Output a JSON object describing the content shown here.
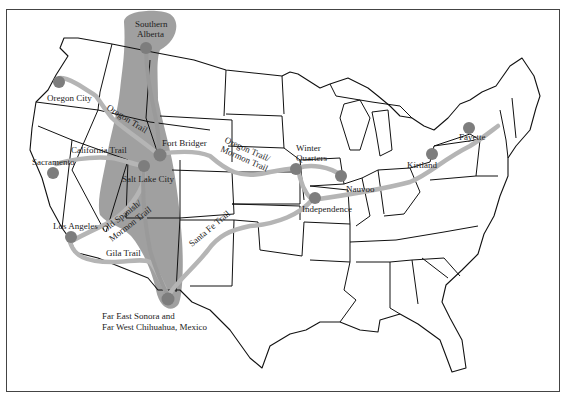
{
  "map": {
    "subject": "Western United States migration trails map",
    "colors": {
      "background": "#ffffff",
      "state_lines": "#111111",
      "trail_lines": "#b5b5b5",
      "settlement_region": "#8f8f8f",
      "location_markers": "#7d7d7d",
      "frame": "#444444"
    },
    "locations": [
      {
        "id": "southern-alberta",
        "label_line1": "Southern",
        "label_line2": "Alberta"
      },
      {
        "id": "oregon-city",
        "label": "Oregon City"
      },
      {
        "id": "fort-bridger",
        "label": "Fort Bridger"
      },
      {
        "id": "salt-lake-city",
        "label": "Salt Lake City"
      },
      {
        "id": "sacramento",
        "label": "Sacramento"
      },
      {
        "id": "los-angeles",
        "label": "Los Angeles"
      },
      {
        "id": "winter-quarters",
        "label_line1": "Winter",
        "label_line2": "Quarters"
      },
      {
        "id": "nauvoo",
        "label": "Nauvoo"
      },
      {
        "id": "independence",
        "label": "Independence"
      },
      {
        "id": "kirtland",
        "label": "Kirtland"
      },
      {
        "id": "fayette",
        "label": "Fayette"
      },
      {
        "id": "mexico",
        "label_line1": "Far East Sonora and",
        "label_line2": "Far West Chihuahua, Mexico"
      }
    ],
    "trails": [
      {
        "id": "oregon-trail",
        "label": "Oregon Trail"
      },
      {
        "id": "california-trail",
        "label": "California Trail"
      },
      {
        "id": "oregon-mormon-trail",
        "label_line1": "Oregon Trail/",
        "label_line2": "Mormon Trail"
      },
      {
        "id": "old-spanish-mormon-trail",
        "label_line1": "Old Spanish/",
        "label_line2": "Mormon Trail"
      },
      {
        "id": "gila-trail",
        "label": "Gila Trail"
      },
      {
        "id": "santa-fe-trail",
        "label": "Santa Fe Trail"
      }
    ]
  }
}
